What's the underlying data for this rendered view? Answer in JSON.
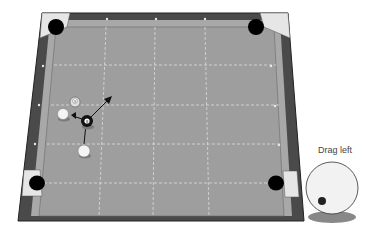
{
  "game": {
    "title": "Pool",
    "table": {
      "rail_color": "#4a4a4a",
      "cushion_color": "#a8a8a8",
      "felt_color": "#9e9e9e",
      "pocket_color": "#000000",
      "corner_plate_color": "#e6e6e6",
      "grid_color": "#dcdcdc",
      "diamond_color": "#e8e8e8"
    },
    "balls": [
      {
        "name": "cue-ball",
        "label": "",
        "x": 63,
        "y": 114,
        "r": 5.5
      },
      {
        "name": "ghost-ball-9",
        "label": "9",
        "x": 75,
        "y": 102,
        "r": 5
      },
      {
        "name": "eight-ball",
        "label": "8",
        "x": 87,
        "y": 121,
        "r": 6
      },
      {
        "name": "cue-ball-start",
        "label": "",
        "x": 84,
        "y": 150,
        "r": 6
      }
    ],
    "aim_arrow": {
      "from_x": 91,
      "from_y": 117,
      "to_x": 111,
      "to_y": 97
    },
    "spin_control": {
      "hint": "Drag left",
      "ball_color": "#f2f2f2",
      "dot_color": "#222222",
      "dot_x": 322,
      "dot_y": 201
    }
  }
}
